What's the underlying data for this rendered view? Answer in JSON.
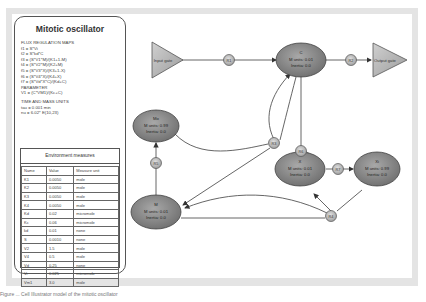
{
  "panel": {
    "title": "Mitotic oscillator",
    "flux_heading": "FLUX REGULATION MAPS",
    "flux": [
      "f1 = S*Vi",
      "f2 = S*kd*C",
      "f3 = (S*V1*M)/(K1+1-M)",
      "f4 = (S*V2*M)/(K2+M)",
      "f5 = (S*V3*X)/(K3+1-X)",
      "f6 = (S*V4*X)/(K4+X)",
      "f7 = (S*Vd*X*C)/(Kd+C)"
    ],
    "param_heading": "PARAMETER",
    "params": [
      "V1 = (C*VM1)/(Kc+C)"
    ],
    "units_heading": "TIME AND MASS UNITS",
    "units": [
      "tau = 0.001 min",
      "nu = 6.02* E(10,23)"
    ]
  },
  "env": {
    "title": "Environment measures",
    "columns": [
      "Name",
      "Value",
      "Measure unit"
    ],
    "rows": [
      [
        "K1",
        "0.0050",
        "mole"
      ],
      [
        "K2",
        "0.0050",
        "mole"
      ],
      [
        "K3",
        "0.0050",
        "mole"
      ],
      [
        "K4",
        "0.0050",
        "mole"
      ],
      [
        "Kd",
        "0.02",
        "micromole"
      ],
      [
        "Kc",
        "0.06",
        "micromole"
      ],
      [
        "kd",
        "0.01",
        "none"
      ],
      [
        "S",
        "0.0010",
        "none"
      ],
      [
        "V2",
        "1.5",
        "mole"
      ],
      [
        "V4",
        "0.5",
        "mole"
      ],
      [
        "Vd",
        "0.25",
        "none"
      ],
      [
        "Vi",
        "0.025",
        "micromole"
      ],
      [
        "Vm1",
        "3.0",
        "mole"
      ]
    ]
  },
  "diagram": {
    "gates": [
      {
        "id": "input",
        "label": "Input gate"
      },
      {
        "id": "output",
        "label": "Output gate"
      }
    ],
    "species": [
      {
        "id": "C",
        "name": "C",
        "line1": "M units: 0.01",
        "line2": "Inertia: 0.0"
      },
      {
        "id": "Mo",
        "name": "Mo",
        "line1": "M units: 0.99",
        "line2": "Inertia: 0.0"
      },
      {
        "id": "M",
        "name": "M",
        "line1": "M units: 0.01",
        "line2": "Inertia: 0.0"
      },
      {
        "id": "X",
        "name": "X",
        "line1": "M units: 0.01",
        "line2": "Inertia: 0.0"
      },
      {
        "id": "Xi",
        "name": "Xi",
        "line1": "M units: 0.99",
        "line2": "Inertia: 0.0"
      }
    ],
    "reactions": [
      {
        "id": "R1",
        "label": "R1"
      },
      {
        "id": "R2",
        "label": "R2"
      },
      {
        "id": "R3",
        "label": "R3"
      },
      {
        "id": "R4",
        "label": "R4"
      },
      {
        "id": "R5",
        "label": "R5"
      },
      {
        "id": "R6",
        "label": "R6"
      },
      {
        "id": "R7",
        "label": "R7"
      }
    ]
  },
  "caption": "Figure ...  Cell Illustrator model of the mitotic oscillator",
  "colors": {
    "node_fill": "#8c8c8c",
    "node_stroke": "#4a4a4a",
    "gate_fill": "#b4b4b4",
    "edge": "#555555"
  }
}
